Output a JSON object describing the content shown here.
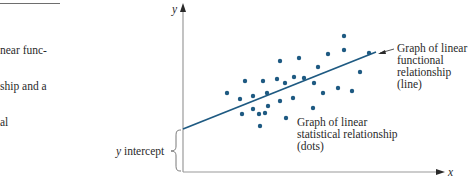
{
  "caption": {
    "lines": [
      "near func-",
      "ship and a",
      "al"
    ]
  },
  "colors": {
    "dot": "#1e5a82",
    "line": "#1e5a82",
    "axis": "#9a9a9a",
    "text": "#2a2a2a"
  },
  "chart_data": {
    "type": "scatter",
    "title": "",
    "xlabel": "x",
    "ylabel": "y",
    "grid": false,
    "annotations": {
      "line_label": [
        "Graph of linear",
        "functional",
        "relationship",
        "(line)"
      ],
      "dots_label": [
        "Graph of linear",
        "statistical relationship",
        "(dots)"
      ],
      "intercept_label": "y intercept"
    },
    "fit_line": {
      "x0_px": 183,
      "y0_px": 129,
      "x1_px": 376,
      "y1_px": 52
    },
    "points_px": [
      [
        344,
        36
      ],
      [
        280,
        61
      ],
      [
        299,
        58
      ],
      [
        328,
        54
      ],
      [
        344,
        50
      ],
      [
        369,
        53
      ],
      [
        318,
        67
      ],
      [
        360,
        72
      ],
      [
        245,
        81
      ],
      [
        263,
        81
      ],
      [
        277,
        79
      ],
      [
        285,
        83
      ],
      [
        294,
        77
      ],
      [
        304,
        78
      ],
      [
        314,
        83
      ],
      [
        227,
        93
      ],
      [
        240,
        99
      ],
      [
        253,
        96
      ],
      [
        267,
        93
      ],
      [
        280,
        101
      ],
      [
        293,
        98
      ],
      [
        323,
        93
      ],
      [
        338,
        88
      ],
      [
        352,
        91
      ],
      [
        242,
        114
      ],
      [
        253,
        109
      ],
      [
        268,
        106
      ],
      [
        259,
        114
      ],
      [
        265,
        113
      ],
      [
        313,
        108
      ],
      [
        286,
        118
      ],
      [
        260,
        126
      ]
    ]
  }
}
